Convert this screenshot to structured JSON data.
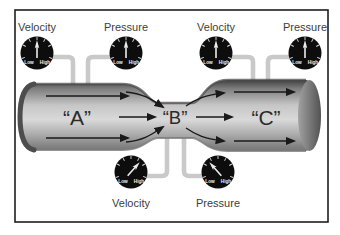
{
  "pipe": {
    "sections": [
      {
        "label": "“A”"
      },
      {
        "label": "“B”"
      },
      {
        "label": "“C”"
      }
    ]
  },
  "gauges": [
    {
      "label": "Velocity",
      "scale_low": "Low",
      "scale_high": "High",
      "reading": "mid"
    },
    {
      "label": "Pressure",
      "scale_low": "Low",
      "scale_high": "High",
      "reading": "mid"
    },
    {
      "label": "Velocity",
      "scale_low": "Low",
      "scale_high": "High",
      "reading": "mid"
    },
    {
      "label": "Pressure",
      "scale_low": "Low",
      "scale_high": "High",
      "reading": "mid"
    },
    {
      "label": "Velocity",
      "scale_low": "Low",
      "scale_high": "High",
      "reading": "high"
    },
    {
      "label": "Pressure",
      "scale_low": "Low",
      "scale_high": "High",
      "reading": "low"
    }
  ],
  "colors": {
    "frame_border": "#1f1f1f",
    "background": "#ffffff",
    "pipe_dark": "#414141",
    "pipe_light": "#d9d9d9",
    "tube": "#c9c9c9",
    "gauge_face": "#0d0d0d",
    "needle": "#ececec",
    "arrow": "#1a1a1a",
    "label_text": "#2b2b2b"
  }
}
